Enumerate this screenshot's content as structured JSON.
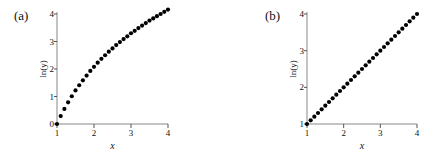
{
  "chart_data": [
    {
      "type": "scatter",
      "panel_label": "(a)",
      "title": "",
      "xlabel": "x",
      "ylabel": "ln(y)",
      "xlim": [
        1,
        4
      ],
      "ylim": [
        0,
        4
      ],
      "xticks": [
        "1",
        "2",
        "3",
        "4"
      ],
      "yticks": [
        "0",
        "1",
        "2",
        "3",
        "4"
      ],
      "grid": false,
      "legend": null,
      "series": [
        {
          "name": "ln(y) = 3 ln(x)",
          "x": [
            1.0,
            1.1,
            1.2,
            1.3,
            1.4,
            1.5,
            1.6,
            1.7,
            1.8,
            1.9,
            2.0,
            2.1,
            2.2,
            2.3,
            2.4,
            2.5,
            2.6,
            2.7,
            2.8,
            2.9,
            3.0,
            3.1,
            3.2,
            3.3,
            3.4,
            3.5,
            3.6,
            3.7,
            3.8,
            3.9,
            4.0
          ],
          "y": [
            0.0,
            0.29,
            0.55,
            0.79,
            1.01,
            1.22,
            1.41,
            1.59,
            1.76,
            1.93,
            2.08,
            2.23,
            2.37,
            2.5,
            2.63,
            2.75,
            2.87,
            2.98,
            3.09,
            3.19,
            3.3,
            3.39,
            3.49,
            3.58,
            3.67,
            3.76,
            3.84,
            3.92,
            4.0,
            4.08,
            4.16
          ]
        }
      ]
    },
    {
      "type": "scatter",
      "panel_label": "(b)",
      "title": "",
      "xlabel": "x",
      "ylabel": "ln(y)",
      "xlim": [
        1,
        4
      ],
      "ylim": [
        1,
        4
      ],
      "xticks": [
        "1",
        "2",
        "3",
        "4"
      ],
      "yticks": [
        "1",
        "2",
        "3",
        "4"
      ],
      "grid": false,
      "legend": null,
      "series": [
        {
          "name": "ln(y) = x",
          "x": [
            1.0,
            1.1,
            1.2,
            1.3,
            1.4,
            1.5,
            1.6,
            1.7,
            1.8,
            1.9,
            2.0,
            2.1,
            2.2,
            2.3,
            2.4,
            2.5,
            2.6,
            2.7,
            2.8,
            2.9,
            3.0,
            3.1,
            3.2,
            3.3,
            3.4,
            3.5,
            3.6,
            3.7,
            3.8,
            3.9,
            4.0
          ],
          "y": [
            1.0,
            1.1,
            1.2,
            1.3,
            1.4,
            1.5,
            1.6,
            1.7,
            1.8,
            1.9,
            2.0,
            2.1,
            2.2,
            2.3,
            2.4,
            2.5,
            2.6,
            2.7,
            2.8,
            2.9,
            3.0,
            3.1,
            3.2,
            3.3,
            3.4,
            3.5,
            3.6,
            3.7,
            3.8,
            3.9,
            4.0
          ]
        }
      ]
    }
  ]
}
